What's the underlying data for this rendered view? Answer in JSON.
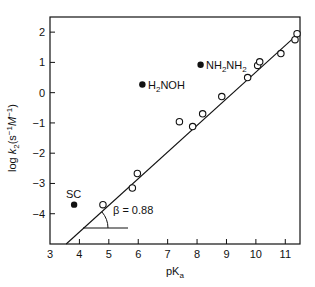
{
  "chart_data": {
    "type": "scatter",
    "title": "",
    "xlabel": "pKa",
    "ylabel": "log k2 (s^-1 M^-1)",
    "xlim": [
      3,
      11.5
    ],
    "ylim": [
      -5,
      2.5
    ],
    "xticks": [
      3,
      4,
      5,
      6,
      7,
      8,
      9,
      10,
      11
    ],
    "yticks": [
      -4,
      -3,
      -2,
      -1,
      0,
      1,
      2
    ],
    "grid": false,
    "legend": null,
    "series": [
      {
        "name": "fitted amines (open circles)",
        "marker": "open-circle",
        "points": [
          [
            4.8,
            -3.7
          ],
          [
            5.8,
            -3.15
          ],
          [
            5.97,
            -2.67
          ],
          [
            7.4,
            -0.96
          ],
          [
            7.85,
            -1.12
          ],
          [
            8.19,
            -0.7
          ],
          [
            8.84,
            -0.13
          ],
          [
            9.72,
            0.5
          ],
          [
            10.06,
            0.9
          ],
          [
            10.13,
            1.02
          ],
          [
            10.85,
            1.29
          ],
          [
            11.33,
            1.75
          ],
          [
            11.4,
            1.95
          ]
        ]
      },
      {
        "name": "deviating nucleophiles (filled circles)",
        "marker": "filled-circle",
        "points": [
          {
            "x": 3.82,
            "y": -3.7,
            "label": "SC"
          },
          {
            "x": 6.14,
            "y": 0.27,
            "label": "H2NOH"
          },
          {
            "x": 8.12,
            "y": 0.92,
            "label": "NH2NH2"
          }
        ]
      }
    ],
    "fit_line": {
      "slope": 0.88,
      "x1": 3.55,
      "y1": -5.0,
      "x2": 11.5,
      "y2": 2.0
    },
    "annotations": [
      "β = 0.88",
      "SC",
      "H2NOH",
      "NH2NH2"
    ]
  },
  "labels": {
    "xlabel_main": "pK",
    "xlabel_sub": "a",
    "ylabel_log": "log ",
    "ylabel_k": "k",
    "ylabel_sub": "2",
    "ylabel_units": "(s",
    "ylabel_sup1": "−1",
    "ylabel_M": "M",
    "ylabel_sup2": "−1",
    "ylabel_close": ")",
    "beta": "β = 0.88",
    "sc": "SC",
    "h2noh_a": "H",
    "h2noh_sub": "2",
    "h2noh_b": "NOH",
    "nh2nh2_a": "NH",
    "nh2nh2_sub1": "2",
    "nh2nh2_b": "NH",
    "nh2nh2_sub2": "2"
  }
}
